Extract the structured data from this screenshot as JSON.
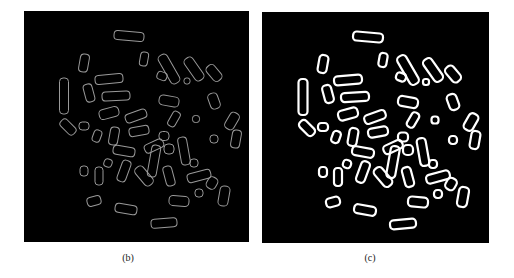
{
  "figure": {
    "panels": [
      {
        "id": "b",
        "caption": "(b)",
        "description": "Chromosome spread edge outlines, faint thin gray contours on black background",
        "stroke_color": "#9a9a9a",
        "stroke_width": 1
      },
      {
        "id": "c",
        "caption": "(c)",
        "description": "Chromosome spread edge outlines, bright thick white contours on black background",
        "stroke_color": "#ffffff",
        "stroke_width": 2.2
      }
    ],
    "background": "#000000"
  }
}
